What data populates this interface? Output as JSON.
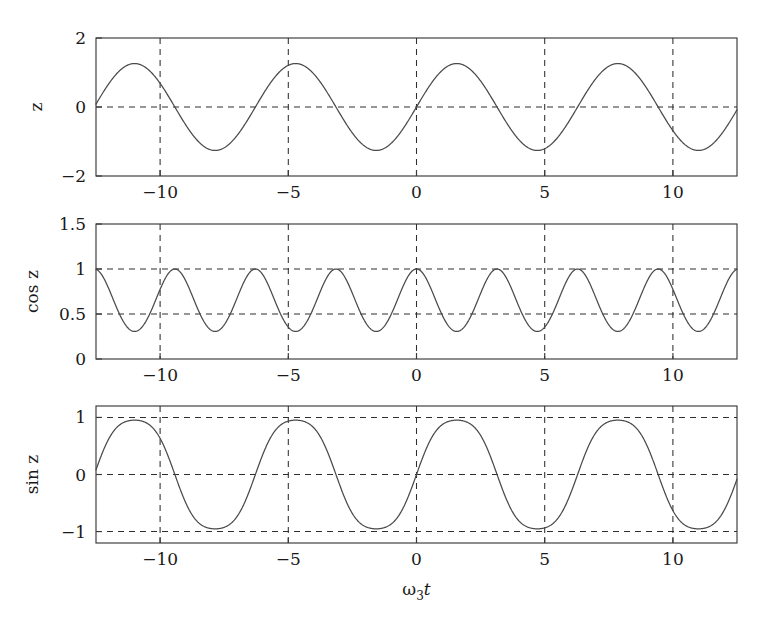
{
  "figure": {
    "background_color": "#ffffff",
    "line_color": "#4a4a4a",
    "axis_color": "#3a3a3a",
    "xlabel_main": "ω",
    "xlabel_sub": "3",
    "xlabel_tail": "t"
  },
  "chart_data": [
    {
      "type": "line",
      "panel_index": 0,
      "title": "",
      "xlabel": "",
      "ylabel": "z",
      "xlim": [
        -12.5,
        12.5
      ],
      "ylim": [
        -2,
        2
      ],
      "xticks": [
        -10,
        -5,
        0,
        5,
        10
      ],
      "xticklabels": [
        "−10",
        "−5",
        "0",
        "5",
        "10"
      ],
      "yticks": [
        -2,
        0,
        2
      ],
      "yticklabels": [
        "−2",
        "0",
        "2"
      ],
      "grid": true,
      "grid_style": "dashed",
      "grid_xvalues": [
        -10,
        -5,
        0,
        5,
        10
      ],
      "grid_yvalues": [
        0
      ],
      "series": [
        {
          "name": "z",
          "formula": "z = 1.26 * sin(t)",
          "amplitude": 1.26,
          "period": 6.2832,
          "phase": 0.0,
          "x": [
            -12.5,
            -11.17,
            -9.42,
            -7.85,
            -6.28,
            -4.71,
            -3.14,
            -1.57,
            0.0,
            1.57,
            3.14,
            4.71,
            6.28,
            7.85,
            9.42,
            11.0,
            12.5
          ],
          "values": [
            0.0,
            1.26,
            0.0,
            -1.26,
            0.0,
            1.26,
            0.0,
            -1.26,
            0.0,
            1.26,
            0.0,
            -1.26,
            0.0,
            1.26,
            0.0,
            -1.26,
            0.0
          ]
        }
      ]
    },
    {
      "type": "line",
      "panel_index": 1,
      "title": "",
      "xlabel": "",
      "ylabel": "cos z",
      "xlim": [
        -12.5,
        12.5
      ],
      "ylim": [
        0,
        1.5
      ],
      "xticks": [
        -10,
        -5,
        0,
        5,
        10
      ],
      "xticklabels": [
        "−10",
        "−5",
        "0",
        "5",
        "10"
      ],
      "yticks": [
        0,
        0.5,
        1,
        1.5
      ],
      "yticklabels": [
        "0",
        "0.5",
        "1",
        "1.5"
      ],
      "grid": true,
      "grid_style": "dashed",
      "grid_xvalues": [
        -10,
        -5,
        0,
        5,
        10
      ],
      "grid_yvalues": [
        0.5,
        1
      ],
      "series": [
        {
          "name": "cos z",
          "formula": "cos(1.26 * sin(t))",
          "min": 0.29,
          "max": 1.0,
          "x": [
            -12.5,
            -10.95,
            -9.42,
            -7.85,
            -6.28,
            -4.71,
            -3.14,
            -1.57,
            0.0,
            1.57,
            3.14,
            4.71,
            6.28,
            7.85,
            9.42,
            11.0,
            12.5
          ],
          "values": [
            1.0,
            0.29,
            1.0,
            0.29,
            1.0,
            0.29,
            1.0,
            0.29,
            1.0,
            0.29,
            1.0,
            0.29,
            1.0,
            0.29,
            1.0,
            0.29,
            1.0
          ]
        }
      ]
    },
    {
      "type": "line",
      "panel_index": 2,
      "title": "",
      "xlabel": "ω3t",
      "ylabel": "sin z",
      "xlim": [
        -12.5,
        12.5
      ],
      "ylim": [
        -1.2,
        1.2
      ],
      "xticks": [
        -10,
        -5,
        0,
        5,
        10
      ],
      "xticklabels": [
        "−10",
        "−5",
        "0",
        "5",
        "10"
      ],
      "yticks": [
        -1,
        0,
        1
      ],
      "yticklabels": [
        "−1",
        "0",
        "1"
      ],
      "grid": true,
      "grid_style": "dashed",
      "grid_xvalues": [
        -10,
        -5,
        0,
        5,
        10
      ],
      "grid_yvalues": [
        -1,
        0,
        1
      ],
      "series": [
        {
          "name": "sin z",
          "formula": "sin(1.26 * sin(t))",
          "min": -0.953,
          "max": 0.953,
          "x": [
            -12.5,
            -11.17,
            -9.42,
            -7.85,
            -6.28,
            -4.71,
            -3.14,
            -1.57,
            0.0,
            1.57,
            3.14,
            4.71,
            6.28,
            7.85,
            9.42,
            11.0,
            12.5
          ],
          "values": [
            0.0,
            0.953,
            0.0,
            -0.953,
            0.0,
            0.953,
            0.0,
            -0.953,
            0.0,
            0.953,
            0.0,
            -0.953,
            0.0,
            0.953,
            0.0,
            -0.953,
            0.0
          ]
        }
      ]
    }
  ]
}
